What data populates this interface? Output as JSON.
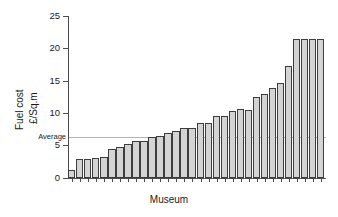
{
  "chart_data": {
    "type": "bar",
    "title": "",
    "xlabel": "Museum",
    "ylabel_line1": "Fuel cost",
    "ylabel_line2": "£/Sq.m",
    "ylim": [
      0,
      25
    ],
    "yticks": [
      0,
      5,
      10,
      15,
      20,
      25
    ],
    "ytick_labels": [
      "0",
      "5",
      "10",
      "15",
      "20",
      "25"
    ],
    "grid": false,
    "legend": null,
    "categories": [
      "1",
      "2",
      "3",
      "4",
      "5",
      "6",
      "7",
      "8",
      "9",
      "10",
      "11",
      "12",
      "13",
      "14",
      "15",
      "16",
      "17",
      "18",
      "19",
      "20",
      "21",
      "22",
      "23",
      "24",
      "25",
      "26",
      "27",
      "28",
      "29",
      "30",
      "31",
      "32"
    ],
    "values": [
      1.2,
      2.8,
      2.85,
      2.95,
      3.1,
      4.35,
      4.8,
      5.2,
      5.6,
      5.7,
      6.2,
      6.5,
      6.9,
      7.2,
      7.6,
      7.6,
      8.5,
      8.5,
      9.5,
      9.5,
      10.3,
      10.6,
      10.5,
      12.5,
      12.9,
      13.9,
      14.7,
      17.2,
      21.5,
      21.5,
      21.5,
      21.5
    ],
    "annotations": [
      {
        "name": "average-line",
        "label": "Average",
        "value": 6.3,
        "color": "#b3b3b3"
      }
    ],
    "bar_fill_color": "#d4d4d4",
    "bar_edge_color": "#3d3d3d",
    "axis_color": "#4d4d4d"
  }
}
